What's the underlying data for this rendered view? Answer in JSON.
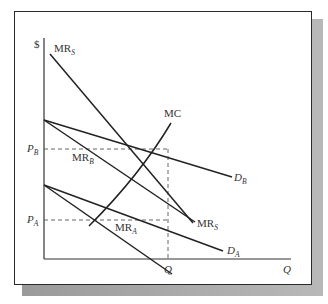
{
  "diagram": {
    "type": "economics-price-discrimination",
    "y_axis_label": "$",
    "x_axis_label": "Q",
    "price_labels": {
      "p_b": "P",
      "p_b_sub": "B",
      "p_a": "P",
      "p_a_sub": "A"
    },
    "quantity_label": "Q",
    "curves": [
      {
        "id": "MR_S",
        "label": "MR",
        "sub": "S"
      },
      {
        "id": "MC",
        "label": "MC"
      },
      {
        "id": "D_B",
        "label": "D",
        "sub": "B"
      },
      {
        "id": "MR_B",
        "label": "MR",
        "sub": "B"
      },
      {
        "id": "D_A",
        "label": "D",
        "sub": "A"
      },
      {
        "id": "MR_A",
        "label": "MR",
        "sub": "A"
      }
    ]
  }
}
